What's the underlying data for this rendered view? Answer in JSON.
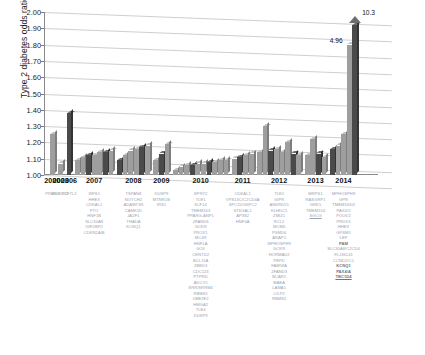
{
  "chart": {
    "ylabel": "Type 2 diabetes odds ratio",
    "y_ticks": [
      "2.00",
      "1.90",
      "1.80",
      "1.70",
      "1.60",
      "1.50",
      "1.40",
      "1.30",
      "1.20",
      "1.10",
      "1.00"
    ],
    "ylim_min": 1.0,
    "ylim_max": 2.0,
    "annotations": [
      {
        "text": "4.96",
        "name": "callout-496"
      },
      {
        "text": "10.3",
        "name": "callout-103"
      }
    ]
  },
  "chart_data": {
    "type": "bar",
    "title": "",
    "subtitle": "",
    "xlabel": "",
    "ylabel": "Type 2 diabetes odds ratio",
    "ylim": [
      1.0,
      2.0
    ],
    "grid": true,
    "legend": null,
    "note": "3-D column chart of type 2 diabetes risk-variant odds ratios, grouped by year of discovery (2000-2014). Two right-most columns are axis-broken and labelled with their true values 4.96 and 10.3.",
    "categories": [
      "2000",
      "2003",
      "2006",
      "2007",
      "2008",
      "2009",
      "2010",
      "2011",
      "2012",
      "2013",
      "2014"
    ],
    "bars": [
      {
        "year": "2000",
        "value": 1.25,
        "shade": "light"
      },
      {
        "year": "2003",
        "value": 1.07,
        "shade": "light"
      },
      {
        "year": "2006",
        "value": 1.38,
        "shade": "dark"
      },
      {
        "year": "2007",
        "value": 1.09,
        "shade": "light"
      },
      {
        "year": "2007",
        "value": 1.11,
        "shade": "light"
      },
      {
        "year": "2007",
        "value": 1.12,
        "shade": "dark"
      },
      {
        "year": "2007",
        "value": 1.12,
        "shade": "light"
      },
      {
        "year": "2007",
        "value": 1.14,
        "shade": "light"
      },
      {
        "year": "2007",
        "value": 1.14,
        "shade": "dark"
      },
      {
        "year": "2007",
        "value": 1.15,
        "shade": "light"
      },
      {
        "year": "2008",
        "value": 1.09,
        "shade": "dark"
      },
      {
        "year": "2008",
        "value": 1.12,
        "shade": "light"
      },
      {
        "year": "2008",
        "value": 1.15,
        "shade": "light"
      },
      {
        "year": "2008",
        "value": 1.16,
        "shade": "light"
      },
      {
        "year": "2008",
        "value": 1.17,
        "shade": "dark"
      },
      {
        "year": "2008",
        "value": 1.18,
        "shade": "light"
      },
      {
        "year": "2009",
        "value": 1.09,
        "shade": "light"
      },
      {
        "year": "2009",
        "value": 1.13,
        "shade": "dark"
      },
      {
        "year": "2009",
        "value": 1.19,
        "shade": "light"
      },
      {
        "year": "2010",
        "value": 1.03,
        "shade": "light"
      },
      {
        "year": "2010",
        "value": 1.05,
        "shade": "light"
      },
      {
        "year": "2010",
        "value": 1.06,
        "shade": "light"
      },
      {
        "year": "2010",
        "value": 1.06,
        "shade": "dark"
      },
      {
        "year": "2010",
        "value": 1.07,
        "shade": "light"
      },
      {
        "year": "2010",
        "value": 1.07,
        "shade": "light"
      },
      {
        "year": "2010",
        "value": 1.08,
        "shade": "dark"
      },
      {
        "year": "2010",
        "value": 1.08,
        "shade": "light"
      },
      {
        "year": "2010",
        "value": 1.09,
        "shade": "light"
      },
      {
        "year": "2010",
        "value": 1.09,
        "shade": "light"
      },
      {
        "year": "2011",
        "value": 1.1,
        "shade": "light"
      },
      {
        "year": "2011",
        "value": 1.11,
        "shade": "dark"
      },
      {
        "year": "2011",
        "value": 1.12,
        "shade": "light"
      },
      {
        "year": "2011",
        "value": 1.13,
        "shade": "light"
      },
      {
        "year": "2012",
        "value": 1.14,
        "shade": "light"
      },
      {
        "year": "2012",
        "value": 1.3,
        "shade": "light"
      },
      {
        "year": "2012",
        "value": 1.15,
        "shade": "dark"
      },
      {
        "year": "2012",
        "value": 1.16,
        "shade": "light"
      },
      {
        "year": "2012",
        "value": 1.14,
        "shade": "light"
      },
      {
        "year": "2012",
        "value": 1.2,
        "shade": "light"
      },
      {
        "year": "2012",
        "value": 1.13,
        "shade": "dark"
      },
      {
        "year": "2012",
        "value": 1.12,
        "shade": "light"
      },
      {
        "year": "2013",
        "value": 1.12,
        "shade": "light"
      },
      {
        "year": "2013",
        "value": 1.22,
        "shade": "light"
      },
      {
        "year": "2013",
        "value": 1.13,
        "shade": "dark"
      },
      {
        "year": "2013",
        "value": 1.11,
        "shade": "light"
      },
      {
        "year": "2014",
        "value": 1.16,
        "shade": "dark"
      },
      {
        "year": "2014",
        "value": 1.18,
        "shade": "light"
      },
      {
        "year": "2014",
        "value": 1.25,
        "shade": "light"
      },
      {
        "year": "2014",
        "value": 1.8,
        "shade": "light",
        "label": "4.96",
        "broken": true
      },
      {
        "year": "2014",
        "value": 1.92,
        "shade": "dark",
        "label": "10.3",
        "broken": true
      }
    ]
  },
  "columns": [
    {
      "year": "2000",
      "genes": [
        {
          "t": "PPARG"
        }
      ]
    },
    {
      "year": "2003",
      "genes": [
        {
          "t": "KCNJ11"
        }
      ]
    },
    {
      "year": "2006",
      "genes": [
        {
          "t": "TCF7L2"
        }
      ]
    },
    {
      "year": "2007",
      "genes": [
        {
          "t": "WFS1"
        },
        {
          "t": "HHEX"
        },
        {
          "t": "CDKAL1"
        },
        {
          "t": "FTO"
        },
        {
          "t": "HNF1B"
        },
        {
          "t": "SLC30A8"
        },
        {
          "t": "IGF2BP2"
        },
        {
          "t": "CDKN2A/B"
        }
      ]
    },
    {
      "year": "2008",
      "genes": [
        {
          "t": "TSPAN8"
        },
        {
          "t": "NOTCH2"
        },
        {
          "t": "ADAMTS9"
        },
        {
          "t": "CAMK1D"
        },
        {
          "t": "JAZF1"
        },
        {
          "t": "THADA"
        },
        {
          "t": "KCNQ1"
        }
      ]
    },
    {
      "year": "2009",
      "genes": [
        {
          "t": "DUSP9"
        },
        {
          "t": "MTNR1B"
        },
        {
          "t": "IRS1"
        }
      ]
    },
    {
      "year": "2010",
      "genes": [
        {
          "t": "SPRY2"
        },
        {
          "t": "TLE1"
        },
        {
          "t": "KLF14"
        },
        {
          "t": "TMEM163"
        },
        {
          "t": "PPARG-ANP1"
        },
        {
          "t": "ZFAND6"
        },
        {
          "t": "GCKR"
        },
        {
          "t": "PROX1"
        },
        {
          "t": "MC4R"
        },
        {
          "t": "HNF1A"
        },
        {
          "t": "GCK"
        },
        {
          "t": "CENTD2"
        },
        {
          "t": "BCL11A"
        },
        {
          "t": "ZBED3"
        },
        {
          "t": "CDC123"
        },
        {
          "t": "PTPRD"
        },
        {
          "t": "ADCY5"
        },
        {
          "t": "SRR/SRRM4"
        },
        {
          "t": "RBMS1"
        },
        {
          "t": "UBE2E2"
        },
        {
          "t": "HMGA2"
        },
        {
          "t": "TLE4"
        },
        {
          "t": "DUSP9"
        }
      ]
    },
    {
      "year": "2011",
      "genes": [
        {
          "t": "CDKAL1"
        },
        {
          "t": "VPS13C/C2CD4A"
        },
        {
          "t": "SPC25/G6PC2"
        },
        {
          "t": "ST6GAL1"
        },
        {
          "t": "AP3S2"
        },
        {
          "t": "HNF4A"
        }
      ]
    },
    {
      "year": "2012",
      "genes": [
        {
          "t": "TLE1"
        },
        {
          "t": "GIPR"
        },
        {
          "t": "ANKRD55"
        },
        {
          "t": "KLHDC5"
        },
        {
          "t": "ZMIZ1"
        },
        {
          "t": "RCL2"
        },
        {
          "t": "MCM6"
        },
        {
          "t": "PSMD6"
        },
        {
          "t": "ARAP1"
        },
        {
          "t": "MPHOSPH9"
        },
        {
          "t": "GCKR"
        },
        {
          "t": "HORMAD2"
        },
        {
          "t": "PEPD"
        },
        {
          "t": "FAM58A"
        },
        {
          "t": "ZFAND3"
        },
        {
          "t": "BCAR1"
        },
        {
          "t": "MAEA"
        },
        {
          "t": "LAMA1"
        },
        {
          "t": "CILP2"
        },
        {
          "t": "RBMS2"
        }
      ]
    },
    {
      "year": "2013",
      "genes": [
        {
          "t": "MRPS1"
        },
        {
          "t": "RASGRP1"
        },
        {
          "t": "GRK5"
        },
        {
          "t": "TMEM154"
        },
        {
          "t": "SGCG",
          "ul": true
        }
      ]
    },
    {
      "year": "2014",
      "genes": [
        {
          "t": "MPHOSPH9"
        },
        {
          "t": "GPR"
        },
        {
          "t": "TMEM163/4"
        },
        {
          "t": "PAX4/2"
        },
        {
          "t": "POLK/2"
        },
        {
          "t": "PRDX3"
        },
        {
          "t": "HHEX"
        },
        {
          "t": "GPSM1"
        },
        {
          "t": "LEP"
        },
        {
          "t": "PAM",
          "bold": true
        },
        {
          "t": "SLC30A8/C2CD4"
        },
        {
          "t": "FLJ36141"
        },
        {
          "t": "CCND2/C1"
        },
        {
          "t": "KCNQ1",
          "bold": true
        },
        {
          "t": "PAX4/A",
          "bold": true
        },
        {
          "t": "TBC1D4",
          "bold": true,
          "ul": true
        }
      ]
    }
  ]
}
